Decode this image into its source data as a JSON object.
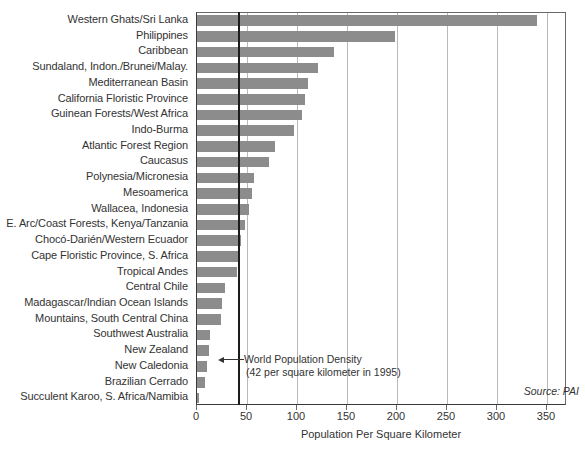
{
  "chart_data": {
    "type": "bar",
    "orientation": "horizontal",
    "title": "",
    "xlabel": "Population Per Square Kilometer",
    "ylabel": "",
    "xlim": [
      0,
      370
    ],
    "xticks": [
      0,
      50,
      100,
      150,
      200,
      250,
      300,
      350
    ],
    "grid": "vertical",
    "legend": "none",
    "bar_color": "#8c8c8c",
    "categories": [
      "Western Ghats/Sri Lanka",
      "Philippines",
      "Caribbean",
      "Sundaland, Indon./Brunei/Malay.",
      "Mediterranean Basin",
      "California Floristic Province",
      "Guinean Forests/West Africa",
      "Indo-Burma",
      "Atlantic Forest Region",
      "Caucasus",
      "Polynesia/Micronesia",
      "Mesoamerica",
      "Wallacea, Indonesia",
      "E. Arc/Coast Forests, Kenya/Tanzania",
      "Chocó-Darién/Western Ecuador",
      "Cape Floristic Province, S. Africa",
      "Tropical Andes",
      "Central Chile",
      "Madagascar/Indian Ocean Islands",
      "Mountains, South Central China",
      "Southwest Australia",
      "New Zealand",
      "New Caledonia",
      "Brazilian Cerrado",
      "Succulent Karoo, S. Africa/Namibia"
    ],
    "values": [
      340,
      198,
      137,
      121,
      111,
      108,
      105,
      97,
      78,
      72,
      57,
      55,
      52,
      48,
      44,
      42,
      40,
      28,
      25,
      24,
      13,
      12,
      10,
      8,
      2
    ],
    "annotations": [
      {
        "name": "world-population-density",
        "line1": "World Population Density",
        "line2": "(42 per square kilometer in 1995)",
        "value": 42,
        "marker": "vertical-line",
        "marker_color": "#1c1c1c"
      }
    ],
    "source": "Source: PAI"
  }
}
